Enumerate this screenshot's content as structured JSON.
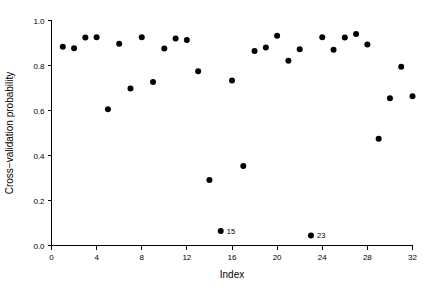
{
  "chart_data": {
    "type": "scatter",
    "title": "",
    "xlabel": "Index",
    "ylabel": "Cross−validation probability",
    "xlim": [
      0,
      32
    ],
    "ylim": [
      0.0,
      1.0
    ],
    "grid": false,
    "legend": null,
    "x_ticks": [
      0,
      4,
      8,
      12,
      16,
      20,
      24,
      28,
      32
    ],
    "x_tick_labels": [
      "0",
      "4",
      "8",
      "12",
      "16",
      "20",
      "24",
      "28",
      "32"
    ],
    "y_ticks": [
      0.0,
      0.2,
      0.4,
      0.6,
      0.8,
      1.0
    ],
    "y_tick_labels": [
      "0.0",
      "0.2",
      "0.4",
      "0.6",
      "0.8",
      "1.0"
    ],
    "marker": "filled-circle",
    "marker_color": "#000000",
    "marker_size": 3,
    "x": [
      1,
      2,
      3,
      4,
      5,
      6,
      7,
      8,
      9,
      10,
      11,
      12,
      13,
      14,
      15,
      16,
      17,
      18,
      19,
      20,
      21,
      22,
      23,
      24,
      25,
      26,
      27,
      28,
      29,
      30,
      31,
      32
    ],
    "y": [
      0.883,
      0.877,
      0.925,
      0.926,
      0.606,
      0.897,
      0.698,
      0.926,
      0.727,
      0.876,
      0.92,
      0.913,
      0.775,
      0.291,
      0.065,
      0.733,
      0.353,
      0.865,
      0.88,
      0.932,
      0.821,
      0.872,
      0.045,
      0.926,
      0.87,
      0.925,
      0.94,
      0.893,
      0.474,
      0.654,
      0.794,
      0.663
    ],
    "annotations": [
      {
        "index": 15,
        "label": "15",
        "x": 15,
        "y": 0.065
      },
      {
        "index": 23,
        "label": "23",
        "x": 23,
        "y": 0.045
      }
    ]
  }
}
